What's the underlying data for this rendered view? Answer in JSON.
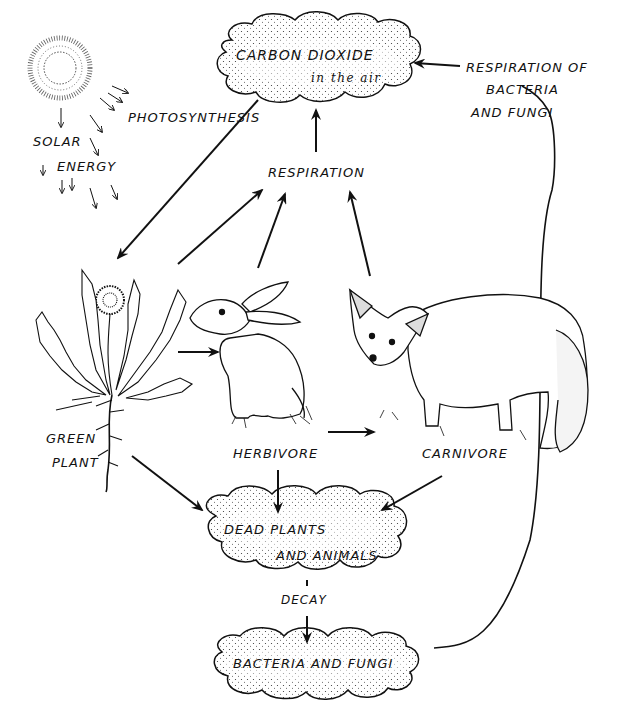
{
  "diagram": {
    "nodes": {
      "co2": {
        "line1": "CARBON DIOXIDE",
        "line2": "in the air"
      },
      "photosynthesis": "PHOTOSYNTHESIS",
      "solar": {
        "line1": "SOLAR",
        "line2": "ENERGY"
      },
      "respiration": "RESPIRATION",
      "resp_bacteria": {
        "line1": "RESPIRATION OF",
        "line2": "BACTERIA",
        "line3": "AND FUNGI"
      },
      "green_plant": {
        "line1": "GREEN",
        "line2": "PLANT"
      },
      "herbivore": "HERBIVORE",
      "carnivore": "CARNIVORE",
      "dead": {
        "line1": "DEAD PLANTS",
        "line2": "AND ANIMALS"
      },
      "decay": "DECAY",
      "bacteria": "BACTERIA AND FUNGI"
    },
    "edges": [
      {
        "from": "CARBON DIOXIDE",
        "to": "GREEN PLANT",
        "label": "PHOTOSYNTHESIS"
      },
      {
        "from": "GREEN PLANT",
        "to": "RESPIRATION"
      },
      {
        "from": "HERBIVORE",
        "to": "RESPIRATION"
      },
      {
        "from": "CARNIVORE",
        "to": "RESPIRATION"
      },
      {
        "from": "RESPIRATION",
        "to": "CARBON DIOXIDE"
      },
      {
        "from": "GREEN PLANT",
        "to": "HERBIVORE"
      },
      {
        "from": "HERBIVORE",
        "to": "CARNIVORE"
      },
      {
        "from": "GREEN PLANT",
        "to": "DEAD PLANTS AND ANIMALS"
      },
      {
        "from": "HERBIVORE",
        "to": "DEAD PLANTS AND ANIMALS"
      },
      {
        "from": "CARNIVORE",
        "to": "DEAD PLANTS AND ANIMALS"
      },
      {
        "from": "DEAD PLANTS AND ANIMALS",
        "to": "BACTERIA AND FUNGI",
        "label": "DECAY"
      },
      {
        "from": "BACTERIA AND FUNGI",
        "to": "CARBON DIOXIDE",
        "label": "RESPIRATION OF BACTERIA AND FUNGI"
      }
    ],
    "illustrations": [
      "sun",
      "dandelion",
      "rabbit",
      "fox"
    ],
    "colors": {
      "ink": "#111111",
      "background": "#ffffff"
    }
  }
}
